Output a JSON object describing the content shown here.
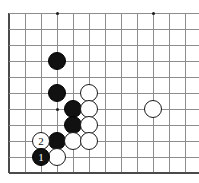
{
  "figure": {
    "kind": "go-board-diagram",
    "caption": "",
    "board": {
      "origin_x": 9,
      "origin_y": 13,
      "spacing": 16,
      "cols": 12,
      "rows": 10,
      "line_color": "#8d8d8d",
      "edge_color": "#4a4a4a",
      "background": "#ffffff",
      "star_points": [
        {
          "col": 3,
          "row": 0,
          "name": "star-point-left"
        },
        {
          "col": 9,
          "row": 0,
          "name": "star-point-right"
        }
      ],
      "inner_mark": {
        "col": 3,
        "row": 6,
        "name": "inner-dot-mark"
      }
    },
    "stones": [
      {
        "id": "b1",
        "color": "black",
        "col": 3,
        "row": 3,
        "label": "",
        "radius": 9
      },
      {
        "id": "b2",
        "color": "black",
        "col": 3,
        "row": 5,
        "label": "",
        "radius": 9
      },
      {
        "id": "b3",
        "color": "black",
        "col": 4,
        "row": 6,
        "label": "",
        "radius": 9
      },
      {
        "id": "b4",
        "color": "black",
        "col": 4,
        "row": 7,
        "label": "",
        "radius": 9
      },
      {
        "id": "b5",
        "color": "black",
        "col": 3,
        "row": 8,
        "label": "",
        "radius": 9
      },
      {
        "id": "w1",
        "color": "white",
        "col": 5,
        "row": 5,
        "label": "",
        "radius": 9
      },
      {
        "id": "w2",
        "color": "white",
        "col": 5,
        "row": 6,
        "label": "",
        "radius": 9
      },
      {
        "id": "w3",
        "color": "white",
        "col": 5,
        "row": 7,
        "label": "",
        "radius": 9
      },
      {
        "id": "w4",
        "color": "white",
        "col": 4,
        "row": 8,
        "label": "",
        "radius": 9
      },
      {
        "id": "w5",
        "color": "white",
        "col": 5,
        "row": 8,
        "label": "",
        "radius": 9
      },
      {
        "id": "w6",
        "color": "white",
        "col": 9,
        "row": 6,
        "label": "",
        "radius": 9
      },
      {
        "id": "w-move2",
        "color": "white",
        "col": 2,
        "row": 8,
        "label": "2",
        "radius": 9
      },
      {
        "id": "b-move1",
        "color": "black",
        "col": 2,
        "row": 9,
        "label": "1",
        "radius": 9
      },
      {
        "id": "w7",
        "color": "white",
        "col": 3,
        "row": 9,
        "label": "",
        "radius": 9
      }
    ],
    "move_numbers": {
      "black_move": "1",
      "white_move": "2"
    }
  }
}
